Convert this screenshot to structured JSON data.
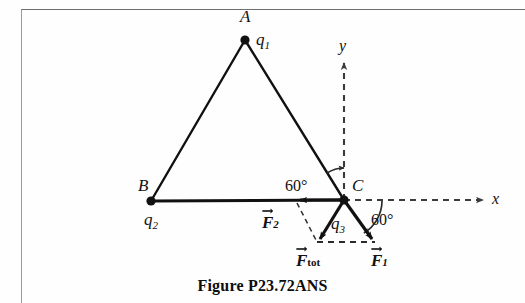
{
  "figure": {
    "caption": "Figure P23.72ANS",
    "vertices": [
      {
        "point_label": "A",
        "charge_label": "q",
        "charge_sub": "1",
        "x": 245,
        "y": 40
      },
      {
        "point_label": "B",
        "charge_label": "q",
        "charge_sub": "2",
        "x": 151,
        "y": 201
      },
      {
        "point_label": "C",
        "charge_label": "q",
        "charge_sub": "3",
        "x": 344,
        "y": 200
      }
    ],
    "axes": {
      "x_label": "x",
      "y_label": "y",
      "x_axis_style": "dashed",
      "y_axis_style": "dashed"
    },
    "angles": [
      {
        "id": "angle-upper",
        "text": "60°",
        "x": 300,
        "y": 186
      },
      {
        "id": "angle-lower",
        "text": "60°",
        "x": 382,
        "y": 220
      }
    ],
    "vectors": [
      {
        "id": "F2",
        "symbol": "F",
        "sub": "2",
        "sub_style": "italic",
        "from": [
          344,
          200
        ],
        "to": [
          297,
          200
        ]
      },
      {
        "id": "Ftot",
        "symbol": "F",
        "sub": "tot",
        "sub_style": "roman",
        "from": [
          344,
          200
        ],
        "to": [
          318,
          242
        ]
      },
      {
        "id": "F1",
        "symbol": "F",
        "sub": "1",
        "sub_style": "italic",
        "from": [
          344,
          200
        ],
        "to": [
          374,
          242
        ]
      }
    ],
    "colors": {
      "ink": "#111111",
      "frame": "#8c8c8c",
      "paper": "#fefefe"
    }
  },
  "labels": {
    "A": "A",
    "B": "B",
    "C": "C",
    "q1_base": "q",
    "q1_sub": "1",
    "q2_base": "q",
    "q2_sub": "2",
    "q3_base": "q",
    "q3_sub": "3",
    "x_axis": "x",
    "y_axis": "y",
    "angle_upper": "60°",
    "angle_lower": "60°",
    "F_symbol": "F",
    "F1_sub": "1",
    "F2_sub": "2",
    "Ftot_sub": "tot",
    "caption": "Figure P23.72ANS"
  }
}
